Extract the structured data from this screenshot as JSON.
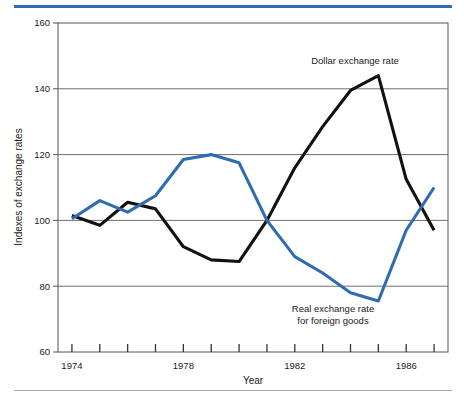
{
  "figure": {
    "name": "exchange-rate-index-line-chart",
    "background": "#ffffff",
    "top_rule_color": "#2f6cb0",
    "bottom_rule_color": "#9aa8bb"
  },
  "chart_data": {
    "type": "line",
    "title": "",
    "xlabel": "Year",
    "ylabel": "Indexes of exchange rates",
    "xlim": [
      1973.5,
      1987.5
    ],
    "ylim": [
      60,
      160
    ],
    "ytick_labels": [
      "60",
      "80",
      "100",
      "120",
      "140",
      "160"
    ],
    "yticks": [
      60,
      80,
      100,
      120,
      140,
      160
    ],
    "xtick_values": [
      1974,
      1975,
      1976,
      1977,
      1978,
      1979,
      1980,
      1981,
      1982,
      1983,
      1984,
      1985,
      1986,
      1987
    ],
    "xtick_labels_shown": [
      "1974",
      "1978",
      "1982",
      "1986"
    ],
    "xtick_labels_positions": [
      1974,
      1978,
      1982,
      1986
    ],
    "grid": "horizontal",
    "grid_color": "#6f6f6f",
    "legend_position": "inline-annotations",
    "x": [
      1974,
      1975,
      1976,
      1977,
      1978,
      1979,
      1980,
      1981,
      1982,
      1983,
      1984,
      1985,
      1986,
      1987
    ],
    "series": [
      {
        "name": "Dollar exchange rate",
        "color": "#111111",
        "linewidth": 3.1,
        "values": [
          101.5,
          98.5,
          105.5,
          103.5,
          92.0,
          88.0,
          87.5,
          100.0,
          116.0,
          128.5,
          139.5,
          144.0,
          112.5,
          97.0
        ]
      },
      {
        "name": "Real exchange rate for foreign goods",
        "color": "#2f6cb0",
        "linewidth": 3.1,
        "values": [
          100.5,
          106.0,
          102.5,
          107.5,
          118.5,
          120.0,
          117.5,
          100.0,
          89.0,
          84.0,
          78.0,
          75.5,
          97.0,
          110.0
        ]
      }
    ],
    "annotations": [
      {
        "id": "dollar-exchange-rate-label",
        "lines": [
          "Dollar exchange rate"
        ],
        "x_px": 355,
        "y_px": 64,
        "anchor": "middle"
      },
      {
        "id": "real-exchange-rate-label",
        "lines": [
          "Real exchange rate",
          "for foreign goods"
        ],
        "x_px": 333,
        "y_px": 312,
        "anchor": "middle"
      }
    ]
  },
  "axes": {
    "y_axis_title": "Indexes of exchange rates",
    "x_axis_title": "Year",
    "y_labels": [
      "160",
      "140",
      "120",
      "100",
      "80",
      "60"
    ],
    "x_labels": [
      "1974",
      "1978",
      "1982",
      "1986"
    ]
  }
}
